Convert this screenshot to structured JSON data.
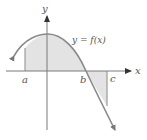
{
  "figure": {
    "function_label": "y = f(x)",
    "x_axis_label": "x",
    "y_axis_label": "y",
    "point_labels": {
      "a": "a",
      "b": "b",
      "c": "c"
    }
  },
  "colors": {
    "curve": "#8a8a8a",
    "axis": "#7a7a7a",
    "arrowhead": "#333333",
    "shade": "#e3e3e3",
    "text": "#555555"
  }
}
